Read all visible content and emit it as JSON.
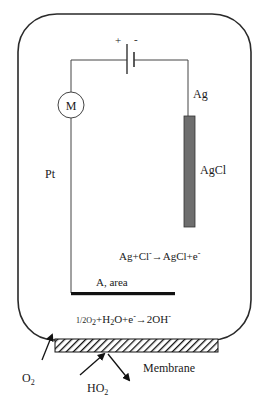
{
  "diagram": {
    "type": "electrochemical oxygen sensor (Clark-type cell)",
    "labels": {
      "battery_plus": "+",
      "battery_minus": "-",
      "meter": "M",
      "silver_wire": "Ag",
      "silver_chloride": "AgCl",
      "platinum": "Pt",
      "cathode_area": "A, area",
      "membrane": "Membrane",
      "oxygen": {
        "base": "O",
        "sub": "2"
      },
      "hydroperoxyl": {
        "base": "HO",
        "sub": "2"
      }
    },
    "reactions": {
      "anode": {
        "parts": [
          "Ag+Cl",
          "-",
          "→AgCl+e",
          "-"
        ]
      },
      "cathode": {
        "parts": [
          "1/2O",
          "2",
          "+H",
          "2",
          "O+e",
          "-",
          "→2OH",
          "-"
        ]
      }
    },
    "colors": {
      "line": "#2a2a2a",
      "electrode_fill": "#6e6e6e",
      "cathode_plate": "#111111",
      "membrane_hatch": "#111111",
      "background": "#ffffff"
    }
  }
}
